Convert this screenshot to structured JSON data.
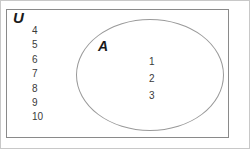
{
  "figure": {
    "type": "venn-diagram",
    "universal_set": {
      "label": "U",
      "outside_members": [
        "4",
        "5",
        "6",
        "7",
        "8",
        "9",
        "10"
      ]
    },
    "set_a": {
      "label": "A",
      "members": [
        "1",
        "2",
        "3"
      ]
    },
    "colors": {
      "background": "#ffffff",
      "rect_border": "#8a8a8a",
      "ellipse_border": "#9a9a9a",
      "outer_border": "#c8c8c8",
      "label_text": "#1a1a1a",
      "member_text": "#3a3a3a"
    }
  }
}
